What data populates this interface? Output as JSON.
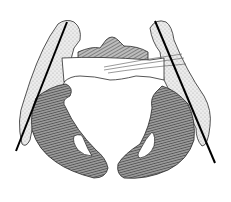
{
  "figure": {
    "subject": "Pelvis anatomical illustration (front view) with two oblique reference lines",
    "background": "#ffffff",
    "colors": {
      "outline": "#2a2a2a",
      "bone_shade": "#8a8a8a",
      "bone_light": "#d8d8d8",
      "stipple": "#bdbdbd",
      "reference_line": "#000000"
    },
    "reference_lines": [
      {
        "name": "left-line",
        "x1": 67,
        "y1": 22,
        "x2": 16,
        "y2": 151
      },
      {
        "name": "right-line",
        "x1": 155,
        "y1": 21,
        "x2": 215,
        "y2": 163
      }
    ]
  }
}
